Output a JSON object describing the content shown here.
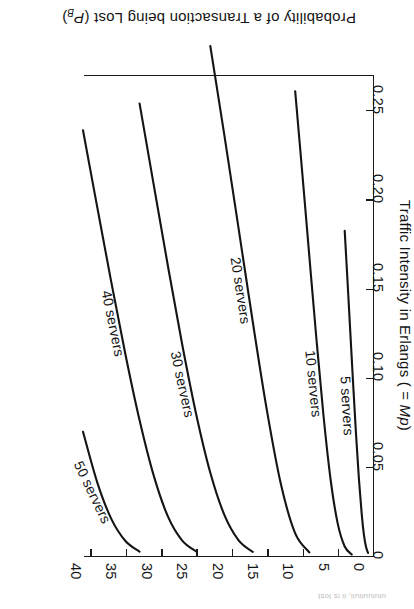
{
  "figure": {
    "caption_fragment": "uiuiuuiiuii, ii is lost"
  },
  "chart_data": {
    "type": "line",
    "title": "",
    "xlabel": "Traffic Intensity in Erlangs ( = Mp)",
    "xlabel_plain": "Traffic Intensity in Erlangs (=Mp)",
    "ylabel": "Probability of a Transaction being Lost (PB)",
    "ylabel_plain": "Probability of a Transaction being Lost (P_B)",
    "xlim": [
      0,
      41
    ],
    "ylim": [
      0,
      0.27
    ],
    "grid": false,
    "legend_position": "inline-curve-labels",
    "xticks": [
      0,
      5,
      10,
      15,
      20,
      25,
      30,
      35,
      40
    ],
    "xtick_labels": [
      "0",
      "5",
      "10",
      "15",
      "20",
      "25",
      "30",
      "35",
      "40"
    ],
    "yticks": [
      0,
      0.05,
      0.1,
      0.15,
      0.2,
      0.25
    ],
    "ytick_labels": [
      "0",
      "0.05",
      "0.10",
      "0.15",
      "0.20",
      "0.25"
    ],
    "series": [
      {
        "name": "5 servers",
        "label": "5 servers",
        "x": [
          0.7,
          1.0,
          1.3,
          1.6,
          2.0,
          2.4,
          2.8,
          3.2,
          3.6,
          4.0
        ],
        "y": [
          0.0017,
          0.0053,
          0.0124,
          0.0237,
          0.0437,
          0.0683,
          0.0958,
          0.1247,
          0.1538,
          0.1821
        ]
      },
      {
        "name": "10 servers",
        "label": "10 servers",
        "x": [
          3.0,
          4.0,
          5.0,
          6.0,
          7.0,
          8.0,
          9.0,
          10.0,
          11.0
        ],
        "y": [
          0.0008,
          0.0053,
          0.0184,
          0.043,
          0.0787,
          0.1217,
          0.1679,
          0.2146,
          0.2603
        ]
      },
      {
        "name": "20 servers",
        "label": "20 servers",
        "x": [
          9.0,
          11.0,
          13.0,
          15.0,
          17.0,
          19.0,
          21.0,
          23.0
        ],
        "y": [
          0.002,
          0.0127,
          0.0399,
          0.0816,
          0.1312,
          0.1834,
          0.2353,
          0.2856
        ]
      },
      {
        "name": "30 servers",
        "label": "30 servers",
        "x": [
          17.0,
          19.0,
          21.0,
          23.0,
          25.0,
          27.0,
          29.0,
          31.0,
          33.0
        ],
        "y": [
          0.0023,
          0.0088,
          0.0229,
          0.0466,
          0.0794,
          0.119,
          0.1626,
          0.2079,
          0.2534
        ]
      },
      {
        "name": "40 servers",
        "label": "40 servers",
        "x": [
          25.0,
          27.0,
          29.0,
          31.0,
          33.0,
          35.0,
          37.0,
          39.0,
          41.0
        ],
        "y": [
          0.0025,
          0.0088,
          0.0222,
          0.045,
          0.076,
          0.1129,
          0.1534,
          0.1957,
          0.2385
        ]
      },
      {
        "name": "50 servers",
        "label": "50 servers",
        "x": [
          33.0,
          35.0,
          37.0,
          39.0,
          41.0
        ],
        "y": [
          0.0024,
          0.0084,
          0.0208,
          0.0414,
          0.0696
        ]
      }
    ],
    "curve_labels": [
      {
        "text": "5 servers"
      },
      {
        "text": "10 servers"
      },
      {
        "text": "20 servers"
      },
      {
        "text": "30 servers"
      },
      {
        "text": "40 servers"
      },
      {
        "text": "50 servers"
      }
    ]
  }
}
